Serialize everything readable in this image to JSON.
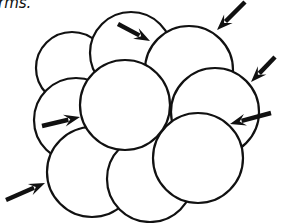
{
  "caption": "rms.",
  "diagram": {
    "stroke_color": "#111111",
    "fill_color": "#ffffff",
    "circles": [
      {
        "id": "top-left",
        "cx": 72,
        "cy": 68,
        "r": 36
      },
      {
        "id": "top-middle",
        "cx": 131,
        "cy": 53,
        "r": 41
      },
      {
        "id": "top-right",
        "cx": 189,
        "cy": 70,
        "r": 44
      },
      {
        "id": "right-middle",
        "cx": 215,
        "cy": 112,
        "r": 44
      },
      {
        "id": "left-middle",
        "cx": 76,
        "cy": 120,
        "r": 42
      },
      {
        "id": "bottom-left",
        "cx": 92,
        "cy": 172,
        "r": 45
      },
      {
        "id": "bottom-middle",
        "cx": 150,
        "cy": 179,
        "r": 43
      },
      {
        "id": "right-lower",
        "cx": 198,
        "cy": 158,
        "r": 45
      },
      {
        "id": "center",
        "cx": 125,
        "cy": 105,
        "r": 45
      }
    ],
    "arrows": [
      {
        "id": "arrow-top-middle",
        "x1": 118,
        "y1": 24,
        "x2": 150,
        "y2": 41
      },
      {
        "id": "arrow-top-right",
        "x1": 245,
        "y1": 2,
        "x2": 217,
        "y2": 30
      },
      {
        "id": "arrow-right-upper",
        "x1": 275,
        "y1": 57,
        "x2": 251,
        "y2": 82
      },
      {
        "id": "arrow-right-lower",
        "x1": 271,
        "y1": 113,
        "x2": 230,
        "y2": 124
      },
      {
        "id": "arrow-left-middle",
        "x1": 42,
        "y1": 126,
        "x2": 80,
        "y2": 117
      },
      {
        "id": "arrow-bottom-left",
        "x1": 6,
        "y1": 200,
        "x2": 45,
        "y2": 183
      }
    ]
  }
}
